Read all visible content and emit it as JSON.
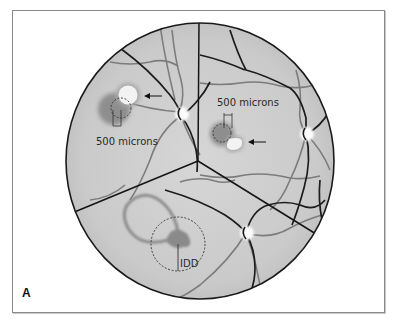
{
  "figure": {
    "panel_label": "A",
    "colors": {
      "fundus_fill": "#cfcfcf",
      "fundus_edge": "#1a1a1a",
      "vessel_dark": "#1c1c1c",
      "vessel_gray": "#7a7a7a",
      "lesion_dark": "#8c8c8c",
      "lesion_light": "#f2f2f2",
      "frame": "#8a8a8a"
    },
    "panels": [
      {
        "id": "top-left",
        "scale_label": "500 microns",
        "arrow": "pointing-left"
      },
      {
        "id": "top-right",
        "scale_label": "500 microns",
        "arrow": "pointing-left"
      },
      {
        "id": "bottom",
        "scale_label": "IDD"
      }
    ]
  }
}
